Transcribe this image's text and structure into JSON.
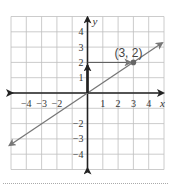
{
  "chart_data": {
    "type": "line",
    "title": "",
    "xlabel": "x",
    "ylabel": "y",
    "xlim": [
      -5,
      5
    ],
    "ylim": [
      -5,
      5
    ],
    "grid": true,
    "x_ticks": [
      -4,
      -3,
      -2,
      1,
      2,
      3,
      4
    ],
    "x_tick_labels": [
      "−4",
      "−3",
      "−2",
      "1",
      "2",
      "3",
      "4"
    ],
    "y_ticks": [
      4,
      3,
      2,
      1,
      -2,
      -3,
      -4
    ],
    "y_tick_labels": [
      "4",
      "3",
      "2",
      "1",
      "−2",
      "−3",
      "−4"
    ],
    "series": [
      {
        "name": "line through origin and (3, 2)",
        "equation": "y = (2/3)x",
        "x": [
          -5,
          5
        ],
        "y": [
          -3.33,
          3.33
        ],
        "color": "#777777",
        "arrows": "both"
      }
    ],
    "points": [
      {
        "x": 3,
        "y": 2,
        "label": "(3, 2)"
      }
    ],
    "annotations": [
      {
        "type": "arrow",
        "from": [
          0,
          0
        ],
        "to": [
          0,
          2
        ],
        "description": "rise of 2"
      },
      {
        "type": "arrow",
        "from": [
          0,
          2
        ],
        "to": [
          3,
          2
        ],
        "description": "run of 3"
      }
    ]
  }
}
